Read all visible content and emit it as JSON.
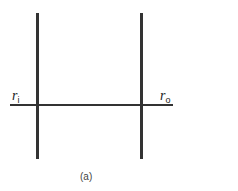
{
  "diagram": {
    "labels": {
      "left": {
        "base": "r",
        "sub": "i"
      },
      "right": {
        "base": "r",
        "sub": "o"
      }
    },
    "caption": "(a)",
    "colors": {
      "line": "#333333",
      "background": "#ffffff"
    }
  }
}
